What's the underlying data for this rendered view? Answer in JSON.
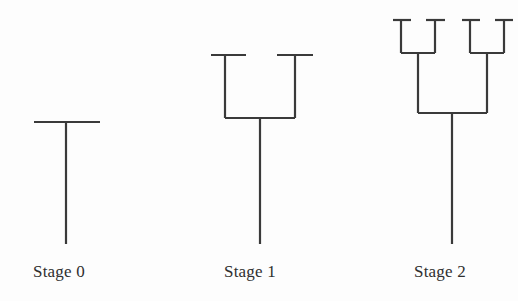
{
  "figure": {
    "background_color": "#fdfdfd",
    "stroke_color": "#3a3a3a",
    "stroke_width": 2.2,
    "width": 518,
    "height": 301
  },
  "labels": [
    {
      "text": "Stage 0",
      "x": 33,
      "y": 277
    },
    {
      "text": "Stage 1",
      "x": 224,
      "y": 277
    },
    {
      "text": "Stage 2",
      "x": 414,
      "y": 277
    }
  ],
  "stages": [
    {
      "name": "stage-0",
      "label": "Stage 0",
      "depth": 0,
      "trunk": {
        "x": 66,
        "y_bottom": 244,
        "y_top": 122
      },
      "crossbars": [
        {
          "y": 122,
          "x1": 34,
          "x2": 100,
          "level": 0
        }
      ],
      "branches": []
    },
    {
      "name": "stage-1",
      "label": "Stage 1",
      "depth": 1,
      "trunk": {
        "x": 260,
        "y_bottom": 244,
        "y_top": 118
      },
      "crossbars": [
        {
          "y": 118,
          "x1": 225,
          "x2": 295,
          "level": 0
        },
        {
          "y": 55,
          "x1": 211,
          "x2": 246,
          "level": 1
        },
        {
          "y": 55,
          "x1": 277,
          "x2": 313,
          "level": 1
        }
      ],
      "branches": [
        {
          "x": 225,
          "y_bottom": 118,
          "y_top": 55,
          "level": 1
        },
        {
          "x": 295,
          "y_bottom": 118,
          "y_top": 55,
          "level": 1
        }
      ]
    },
    {
      "name": "stage-2",
      "label": "Stage 2",
      "depth": 2,
      "trunk": {
        "x": 452,
        "y_bottom": 244,
        "y_top": 113
      },
      "crossbars": [
        {
          "y": 113,
          "x1": 418,
          "x2": 487,
          "level": 0
        },
        {
          "y": 53,
          "x1": 401,
          "x2": 435,
          "level": 1
        },
        {
          "y": 53,
          "x1": 470,
          "x2": 504,
          "level": 1
        },
        {
          "y": 20,
          "x1": 393,
          "x2": 411,
          "level": 2
        },
        {
          "y": 20,
          "x1": 426,
          "x2": 445,
          "level": 2
        },
        {
          "y": 20,
          "x1": 462,
          "x2": 480,
          "level": 2
        },
        {
          "y": 20,
          "x1": 495,
          "x2": 513,
          "level": 2
        }
      ],
      "branches": [
        {
          "x": 418,
          "y_bottom": 113,
          "y_top": 53,
          "level": 1
        },
        {
          "x": 487,
          "y_bottom": 113,
          "y_top": 53,
          "level": 1
        },
        {
          "x": 401,
          "y_bottom": 53,
          "y_top": 20,
          "level": 2
        },
        {
          "x": 435,
          "y_bottom": 53,
          "y_top": 20,
          "level": 2
        },
        {
          "x": 470,
          "y_bottom": 53,
          "y_top": 20,
          "level": 2
        },
        {
          "x": 504,
          "y_bottom": 53,
          "y_top": 20,
          "level": 2
        }
      ]
    }
  ]
}
